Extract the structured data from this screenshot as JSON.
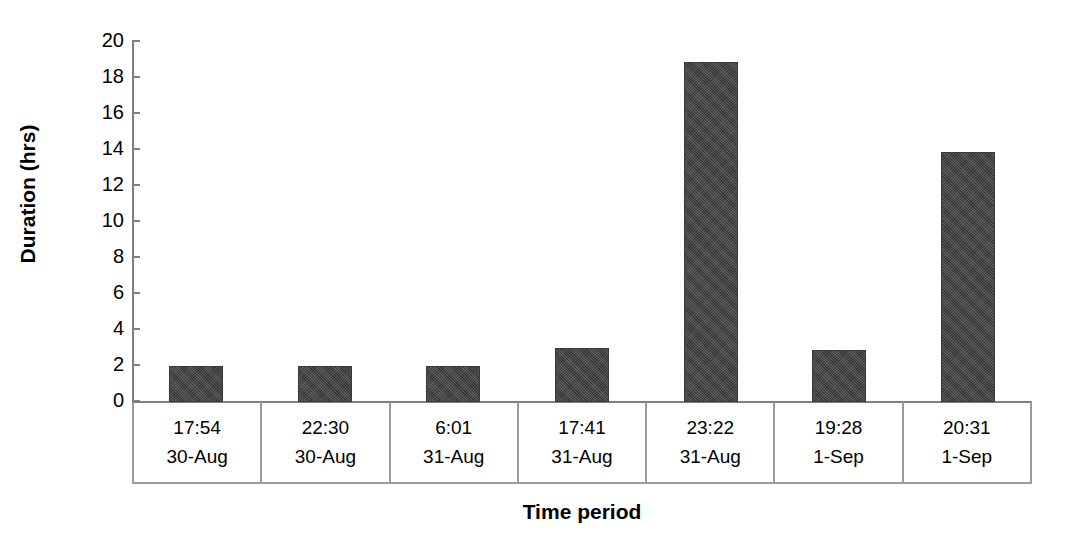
{
  "chart_data": {
    "type": "bar",
    "title": "",
    "xlabel": "Time period",
    "ylabel": "Duration (hrs)",
    "ylim": [
      0,
      20
    ],
    "ytick_step": 2,
    "yticks": [
      20,
      18,
      16,
      14,
      12,
      10,
      8,
      6,
      4,
      2,
      0
    ],
    "grid": false,
    "legend": null,
    "categories": [
      "17:54 30-Aug",
      "22:30 30-Aug",
      "6:01 31-Aug",
      "17:41 31-Aug",
      "23:22 31-Aug",
      "19:28 1-Sep",
      "20:31 1-Sep"
    ],
    "category_parts": [
      {
        "time": "17:54",
        "date": "30-Aug"
      },
      {
        "time": "22:30",
        "date": "30-Aug"
      },
      {
        "time": "6:01",
        "date": "31-Aug"
      },
      {
        "time": "17:41",
        "date": "31-Aug"
      },
      {
        "time": "23:22",
        "date": "31-Aug"
      },
      {
        "time": "19:28",
        "date": "1-Sep"
      },
      {
        "time": "20:31",
        "date": "1-Sep"
      }
    ],
    "values": [
      2.0,
      2.0,
      2.0,
      3.0,
      18.9,
      2.9,
      13.9
    ],
    "bar_color": "#434343",
    "axis_color": "#808080"
  }
}
